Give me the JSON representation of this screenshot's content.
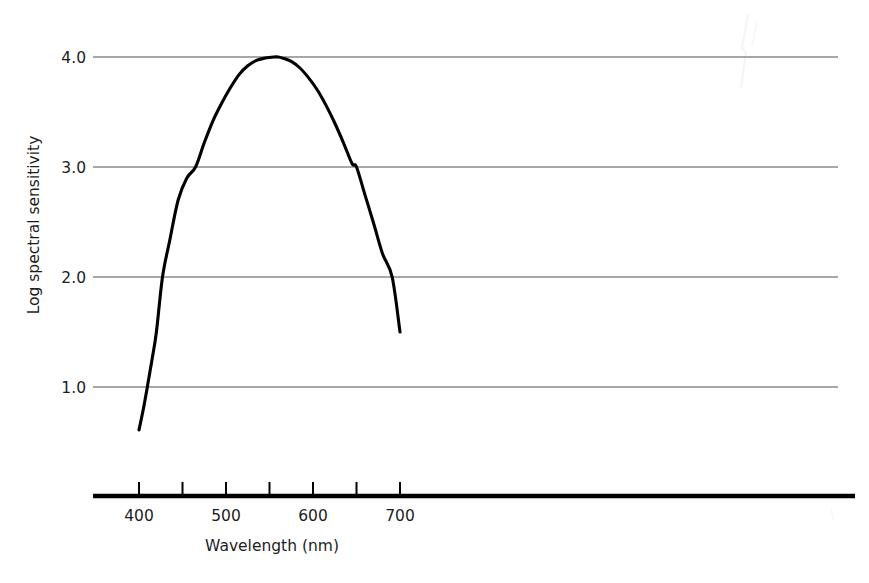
{
  "figure": {
    "background_color": "#ffffff",
    "width": 869,
    "height": 583
  },
  "chart_data": {
    "type": "line",
    "title": "",
    "xlabel": "Wavelength (nm)",
    "ylabel": "Log spectral sensitivity",
    "xlim": [
      345,
      745
    ],
    "ylim": [
      0.0,
      4.4
    ],
    "grid": "horizontal-only",
    "legend": "none",
    "x_ticks_major": [
      400,
      500,
      600,
      700
    ],
    "x_ticks_minor": [
      450,
      550,
      650
    ],
    "x_tick_labels": [
      "400",
      "500",
      "600",
      "700"
    ],
    "y_ticks": [
      1.0,
      2.0,
      3.0,
      4.0
    ],
    "y_tick_labels": [
      "1.0",
      "2.0",
      "3.0",
      "4.0"
    ],
    "series": [
      {
        "name": "Log spectral sensitivity",
        "color": "#000000",
        "line_width": 3,
        "x": [
          400,
          405,
          410,
          415,
          420,
          427,
          435,
          445,
          455,
          465,
          475,
          485,
          495,
          505,
          515,
          525,
          535,
          545,
          555,
          560,
          565,
          575,
          585,
          595,
          605,
          615,
          625,
          635,
          645,
          650,
          660,
          670,
          680,
          691,
          700
        ],
        "y": [
          0.61,
          0.8,
          1.02,
          1.25,
          1.5,
          2.0,
          2.32,
          2.7,
          2.9,
          3.0,
          3.22,
          3.42,
          3.58,
          3.72,
          3.84,
          3.92,
          3.97,
          3.99,
          4.0,
          4.0,
          3.99,
          3.96,
          3.9,
          3.81,
          3.7,
          3.56,
          3.4,
          3.22,
          3.03,
          3.0,
          2.74,
          2.48,
          2.21,
          2.0,
          1.5
        ]
      }
    ],
    "annotations": {
      "peak_wavelength_nm": 560,
      "peak_value": 4.0,
      "curve_start": {
        "x": 400,
        "y": 0.61
      },
      "curve_end": {
        "x": 700,
        "y": 1.5
      }
    }
  },
  "axes": {
    "x_axis_label": "Wavelength (nm)",
    "y_axis_label": "Log spectral sensitivity",
    "x_tick_labels": [
      "400",
      "500",
      "600",
      "700"
    ],
    "y_tick_labels": [
      "4.0",
      "3.0",
      "2.0",
      "1.0"
    ],
    "gridline_color": "#8a8a8a",
    "axis_color": "#000000",
    "curve_color": "#000000"
  }
}
